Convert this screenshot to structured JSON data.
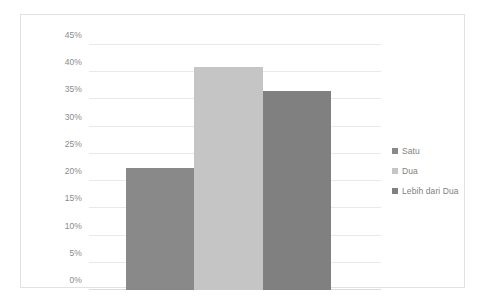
{
  "chart_data": {
    "type": "bar",
    "title": "",
    "xlabel": "",
    "ylabel": "",
    "categories": [
      "Satu",
      "Dua",
      "Lebih dari Dua"
    ],
    "values": [
      22.5,
      41,
      36.5
    ],
    "value_suffix": "%",
    "ylim": [
      0,
      45
    ],
    "ytick_step": 5,
    "yticks": [
      "0%",
      "5%",
      "10%",
      "15%",
      "20%",
      "25%",
      "30%",
      "35%",
      "40%",
      "45%"
    ],
    "ytick_values": [
      0,
      5,
      10,
      15,
      20,
      25,
      30,
      35,
      40,
      45
    ],
    "grid": "horizontal",
    "legend_position": "right",
    "series": [
      {
        "name": "Satu",
        "value": 22.5,
        "color": "#898989"
      },
      {
        "name": "Dua",
        "value": 41,
        "color": "#c5c5c5"
      },
      {
        "name": "Lebih dari Dua",
        "value": 36.5,
        "color": "#808080"
      }
    ]
  },
  "legend": {
    "items": [
      {
        "label": "Satu",
        "color": "#898989"
      },
      {
        "label": "Dua",
        "color": "#c5c5c5"
      },
      {
        "label": "Lebih dari Dua",
        "color": "#808080"
      }
    ]
  },
  "colors": {
    "background": "#ffffff",
    "frame_border": "#e2e2e2",
    "gridline": "#e9e9e9",
    "axis_line": "#dcdcdc",
    "tick_text": "#8b8b8b",
    "legend_text": "#7f7f7f"
  }
}
